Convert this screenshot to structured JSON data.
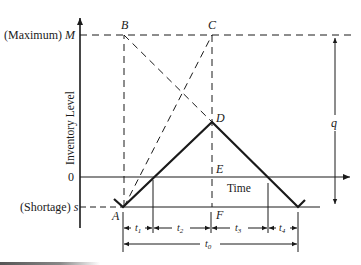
{
  "diagram": {
    "type": "inventory-model-with-shortages",
    "axis": {
      "y_label": "Inventory Level",
      "x_label": "Time",
      "ticks": {
        "max_prefix": "(Maximum)",
        "max_symbol": "M",
        "zero": "0",
        "shortage_prefix": "(Shortage)",
        "shortage_symbol": "s"
      }
    },
    "points": {
      "A": "A",
      "B": "B",
      "C": "C",
      "D": "D",
      "E": "E",
      "F": "F"
    },
    "dimension_q": "q",
    "intervals": {
      "t1": "t",
      "t1_sub": "1",
      "t2": "t",
      "t2_sub": "2",
      "t3": "t",
      "t3_sub": "3",
      "t4": "t",
      "t4_sub": "4",
      "t0": "t",
      "t0_sub": "0"
    },
    "colors": {
      "ink": "#1a1a1a",
      "background": "#ffffff"
    }
  }
}
